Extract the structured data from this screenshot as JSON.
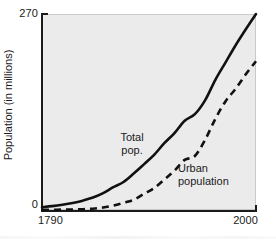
{
  "chart_data": {
    "type": "line",
    "title": "",
    "xlabel": "",
    "ylabel": "Population (in millions)",
    "xlim": [
      1790,
      2000
    ],
    "ylim": [
      0,
      270
    ],
    "grid": false,
    "legend_position": "inline-annotations",
    "x_tick_labels": [
      "1790",
      "2000"
    ],
    "y_tick_labels": [
      "0",
      "270"
    ],
    "series": [
      {
        "name": "Total pop.",
        "style": "solid",
        "color": "#111111",
        "annotation_lines": [
          "Total",
          "pop."
        ],
        "x": [
          1790,
          1800,
          1810,
          1820,
          1830,
          1840,
          1850,
          1860,
          1870,
          1880,
          1890,
          1900,
          1910,
          1920,
          1930,
          1940,
          1950,
          1960,
          1970,
          1980,
          1990,
          2000
        ],
        "values": [
          3.9,
          5.3,
          7.2,
          9.6,
          12.9,
          17.1,
          23.2,
          31.4,
          38.6,
          50.2,
          62.9,
          76.0,
          92.0,
          106.0,
          123.0,
          132.0,
          151.0,
          179.0,
          203.0,
          227.0,
          249.0,
          270.0
        ]
      },
      {
        "name": "Urban population",
        "style": "dashed",
        "color": "#111111",
        "annotation_lines": [
          "Urban",
          "population"
        ],
        "x": [
          1790,
          1800,
          1810,
          1820,
          1830,
          1840,
          1850,
          1860,
          1870,
          1880,
          1890,
          1900,
          1910,
          1920,
          1930,
          1940,
          1950,
          1960,
          1970,
          1980,
          1990,
          2000
        ],
        "values": [
          0.2,
          0.3,
          0.5,
          0.7,
          1.1,
          1.8,
          3.5,
          6.2,
          9.9,
          14.1,
          22.1,
          30.2,
          42.0,
          54.2,
          69.0,
          74.4,
          96.5,
          125.3,
          149.6,
          167.0,
          187.0,
          205.0
        ]
      }
    ]
  },
  "axes": {
    "y_max_label": "270",
    "y_min_label": "0",
    "x_min_label": "1790",
    "x_max_label": "2000",
    "y_axis_title": "Population (in millions)"
  },
  "annotations": {
    "total_line1": "Total",
    "total_line2": "pop.",
    "urban_line1": "Urban",
    "urban_line2": "population"
  },
  "colors": {
    "plot_background": "#ebebeb",
    "page_background": "#ffffff",
    "line": "#111111",
    "axis": "#1b1b1b",
    "text": "#1a1a1a"
  }
}
